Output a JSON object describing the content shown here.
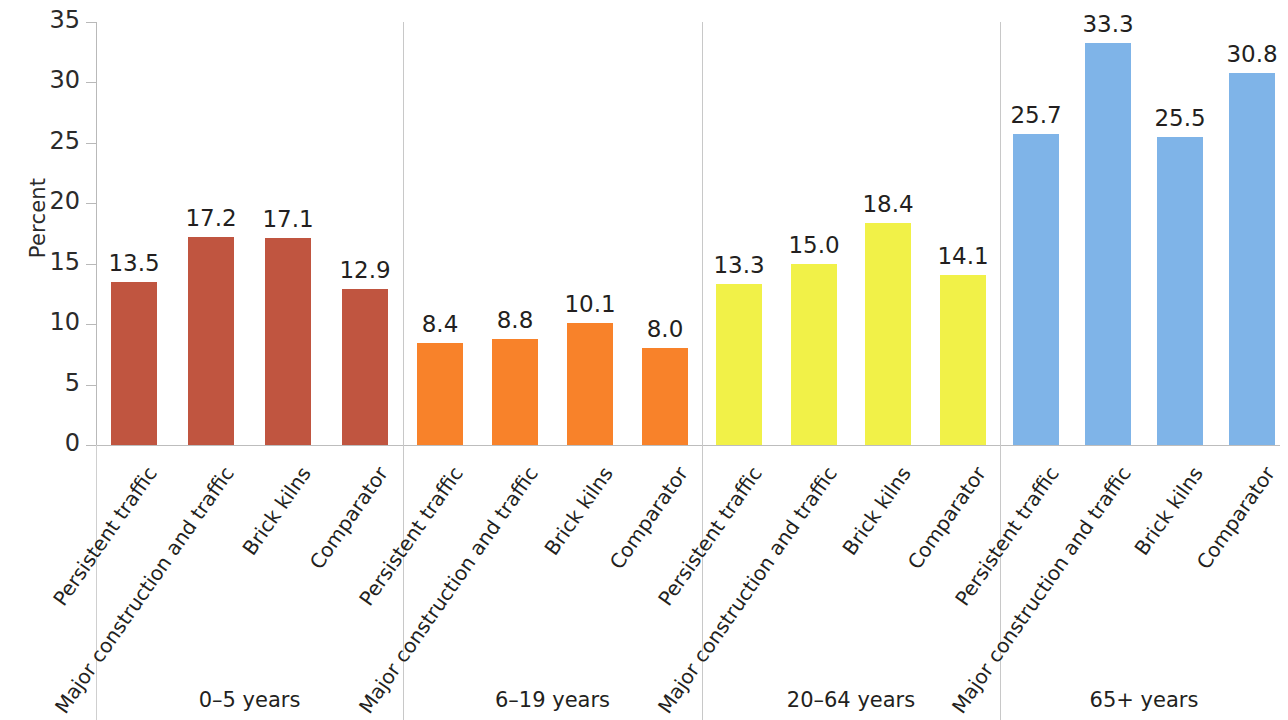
{
  "chart_data": {
    "type": "bar",
    "title": "",
    "xlabel": "",
    "ylabel": "Percent",
    "ylim": [
      0,
      35
    ],
    "yticks": [
      0,
      5,
      10,
      15,
      20,
      25,
      30,
      35
    ],
    "ytick_labels": [
      "0",
      "5",
      "10",
      "15",
      "20",
      "25",
      "30",
      "35"
    ],
    "grid": false,
    "legend": "none",
    "categories": [
      "Persistent traffic",
      "Major construction and traffic",
      "Brick kilns",
      "Comparator"
    ],
    "groups": [
      {
        "name": "0–5 years",
        "color": "#c05540",
        "bars": [
          {
            "category": "Persistent traffic",
            "value": 13.5,
            "label": "13.5"
          },
          {
            "category": "Major construction and traffic",
            "value": 17.2,
            "label": "17.2"
          },
          {
            "category": "Brick kilns",
            "value": 17.1,
            "label": "17.1"
          },
          {
            "category": "Comparator",
            "value": 12.9,
            "label": "12.9"
          }
        ]
      },
      {
        "name": "6–19 years",
        "color": "#f8822a",
        "bars": [
          {
            "category": "Persistent traffic",
            "value": 8.4,
            "label": "8.4"
          },
          {
            "category": "Major construction and traffic",
            "value": 8.8,
            "label": "8.8"
          },
          {
            "category": "Brick kilns",
            "value": 10.1,
            "label": "10.1"
          },
          {
            "category": "Comparator",
            "value": 8.0,
            "label": "8.0"
          }
        ]
      },
      {
        "name": "20–64 years",
        "color": "#f1f148",
        "bars": [
          {
            "category": "Persistent traffic",
            "value": 13.3,
            "label": "13.3"
          },
          {
            "category": "Major construction and traffic",
            "value": 15.0,
            "label": "15.0"
          },
          {
            "category": "Brick kilns",
            "value": 18.4,
            "label": "18.4"
          },
          {
            "category": "Comparator",
            "value": 14.1,
            "label": "14.1"
          }
        ]
      },
      {
        "name": "65+ years",
        "color": "#7fb4e8",
        "bars": [
          {
            "category": "Persistent traffic",
            "value": 25.7,
            "label": "25.7"
          },
          {
            "category": "Major construction and traffic",
            "value": 33.3,
            "label": "33.3"
          },
          {
            "category": "Brick kilns",
            "value": 25.5,
            "label": "25.5"
          },
          {
            "category": "Comparator",
            "value": 30.8,
            "label": "30.8"
          }
        ]
      }
    ]
  },
  "axis": {
    "y_title": "Percent"
  },
  "colors": {
    "axis_line": "#bdbdbd",
    "separator": "#c8c8c8",
    "text": "#231f20",
    "background": "#ffffff"
  }
}
